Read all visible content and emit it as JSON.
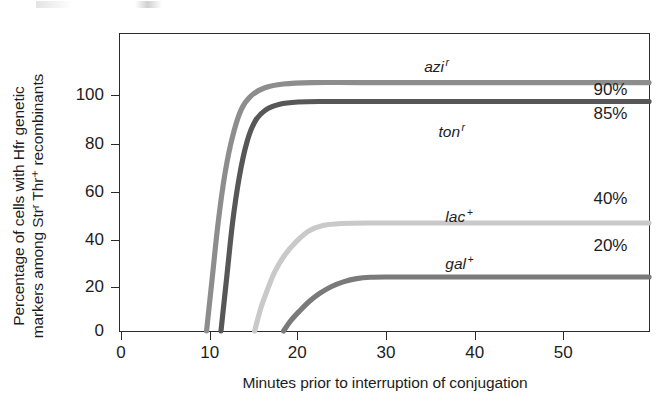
{
  "figure": {
    "background_color": "#ffffff",
    "frame_color": "#2b2b2b",
    "text_color": "#1d1d1d"
  },
  "chart_data": {
    "type": "line",
    "title": "",
    "xlabel": "Minutes prior to interruption of conjugation",
    "ylabel_line1": "Percentage of cells with Hfr genetic",
    "ylabel_line2": "markers among Strʳ Thr⁺ recombinants",
    "xlim": [
      0,
      55
    ],
    "ylim": [
      0,
      110
    ],
    "xticks": [
      0,
      10,
      20,
      30,
      40,
      50
    ],
    "xticklabels": [
      "0",
      "10",
      "20",
      "30",
      "40",
      "50"
    ],
    "yticks": [
      0,
      20,
      40,
      60,
      80,
      100
    ],
    "yticklabels": [
      "0",
      "20",
      "40",
      "60",
      "80",
      "100"
    ],
    "grid": false,
    "legend_position": "inline-right",
    "series": [
      {
        "name": "azi",
        "label_text": "azi",
        "label_sup": "r",
        "color": "#8d8d8d",
        "plateau": 90,
        "plateau_text": "90%",
        "onset_minutes": 9,
        "x": [
          9,
          9.6,
          10.2,
          10.9,
          11.7,
          12.6,
          13.6,
          15,
          17,
          20,
          25,
          35,
          45,
          55
        ],
        "y": [
          0,
          20,
          40,
          58,
          72,
          82,
          87,
          90,
          91.5,
          92,
          92,
          92,
          92,
          92
        ]
      },
      {
        "name": "ton",
        "label_text": "ton",
        "label_sup": "r",
        "color": "#575757",
        "plateau": 85,
        "plateau_text": "85%",
        "onset_minutes": 10.5,
        "x": [
          10.5,
          11.1,
          11.7,
          12.4,
          13.2,
          14.1,
          15.2,
          16.6,
          18.5,
          21,
          26,
          36,
          46,
          55
        ],
        "y": [
          0,
          20,
          40,
          57,
          70,
          78,
          82,
          84,
          84.8,
          85,
          85,
          85,
          85,
          85
        ]
      },
      {
        "name": "lac",
        "label_text": "lac",
        "label_sup": "+",
        "color": "#c9c9c9",
        "plateau": 40,
        "plateau_text": "40%",
        "onset_minutes": 14,
        "x": [
          14,
          14.6,
          15.3,
          16.1,
          17.1,
          18.3,
          19.6,
          21,
          23,
          26,
          32,
          40,
          48,
          55
        ],
        "y": [
          0,
          8,
          15,
          22,
          28,
          33,
          37,
          39,
          39.8,
          40,
          40,
          40,
          40,
          40
        ]
      },
      {
        "name": "gal",
        "label_text": "gal",
        "label_sup": "+",
        "color": "#7a7a7a",
        "plateau": 20,
        "plateau_text": "20%",
        "onset_minutes": 17,
        "x": [
          17,
          17.8,
          18.7,
          19.7,
          20.8,
          22,
          23.3,
          24.6,
          26,
          28,
          32,
          40,
          48,
          55
        ],
        "y": [
          0,
          4,
          7.5,
          11,
          14,
          16.5,
          18.3,
          19.4,
          19.9,
          20,
          20,
          20,
          20,
          20
        ]
      }
    ],
    "annotations": [
      {
        "text": "azi",
        "sup": "r",
        "x_min": 30,
        "y_value": 99
      },
      {
        "text": "ton",
        "sup": "r",
        "x_min": 32,
        "y_value": 77
      },
      {
        "text": "lac",
        "sup": "+",
        "x_min": 33,
        "y_value": 48
      },
      {
        "text": "gal",
        "sup": "+",
        "x_min": 33,
        "y_value": 28
      }
    ]
  }
}
